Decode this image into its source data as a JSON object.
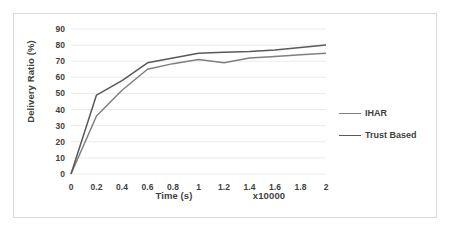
{
  "chart_data": {
    "type": "line",
    "title": "",
    "xlabel": "Time (s)",
    "x_multiplier": "x10000",
    "ylabel": "Delivery Ratio (%)",
    "x": [
      0,
      0.2,
      0.4,
      0.6,
      0.8,
      1,
      1.2,
      1.4,
      1.6,
      1.8,
      2
    ],
    "xtick_labels": [
      "0",
      "0.2",
      "0.4",
      "0.6",
      "0.8",
      "1",
      "1.2",
      "1.4",
      "1.6",
      "1.8",
      "2"
    ],
    "ytick_labels": [
      "0",
      "10",
      "20",
      "30",
      "40",
      "50",
      "60",
      "70",
      "80",
      "90"
    ],
    "xlim": [
      0,
      2
    ],
    "ylim": [
      0,
      90
    ],
    "grid": "horizontal",
    "legend_position": "right",
    "series": [
      {
        "name": "IHAR",
        "color": "#7f7f7f",
        "values": [
          0,
          36,
          52,
          65,
          68.5,
          71,
          69,
          72,
          73,
          74,
          75
        ]
      },
      {
        "name": "Trust Based",
        "color": "#595959",
        "values": [
          0,
          49,
          58,
          69,
          72,
          75,
          75.5,
          76,
          77,
          78.5,
          80
        ]
      }
    ]
  },
  "colors": {
    "frame_border": "#d9d9d9",
    "gridline": "#ebebeb",
    "text": "#3f3f3f",
    "background": "#ffffff"
  }
}
